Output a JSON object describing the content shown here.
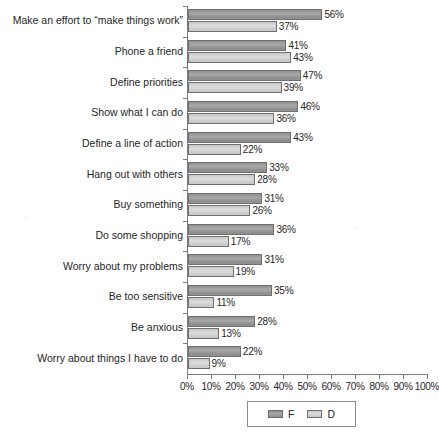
{
  "chart_data": {
    "type": "bar",
    "orientation": "horizontal",
    "title": "",
    "subtitle": "",
    "xlabel": "",
    "ylabel": "",
    "xlim": [
      0,
      100
    ],
    "xticks": [
      "0%",
      "10%",
      "20%",
      "30%",
      "40%",
      "50%",
      "60%",
      "70%",
      "80%",
      "90%",
      "100%"
    ],
    "xtick_values": [
      0,
      10,
      20,
      30,
      40,
      50,
      60,
      70,
      80,
      90,
      100
    ],
    "grid": false,
    "value_suffix": "%",
    "legend_position": "bottom",
    "categories": [
      "Make an effort to “make things work”",
      "Phone a friend",
      "Define priorities",
      "Show what I can do",
      "Define a line of action",
      "Hang out with others",
      "Buy something",
      "Do some shopping",
      "Worry about my problems",
      "Be too sensitive",
      "Be anxious",
      "Worry about things I have to do"
    ],
    "series": [
      {
        "name": "F",
        "color": "#9a9a9a",
        "values": [
          56,
          41,
          47,
          46,
          43,
          33,
          31,
          36,
          31,
          35,
          28,
          22
        ],
        "labels": [
          "56%",
          "41%",
          "47%",
          "46%",
          "43%",
          "33%",
          "31%",
          "36%",
          "31%",
          "35%",
          "28%",
          "22%"
        ]
      },
      {
        "name": "D",
        "color": "#d4d4d4",
        "values": [
          37,
          43,
          39,
          36,
          22,
          28,
          26,
          17,
          19,
          11,
          13,
          9
        ],
        "labels": [
          "37%",
          "43%",
          "39%",
          "36%",
          "22%",
          "28%",
          "26%",
          "17%",
          "19%",
          "11%",
          "13%",
          "9%"
        ]
      }
    ]
  },
  "legend": {
    "entries": [
      {
        "label": "F"
      },
      {
        "label": "D"
      }
    ]
  },
  "colors": {
    "series_f": "#9a9a9a",
    "series_d": "#d4d4d4",
    "axis": "#7d7d7d",
    "text": "#262626",
    "background": "#ffffff"
  }
}
